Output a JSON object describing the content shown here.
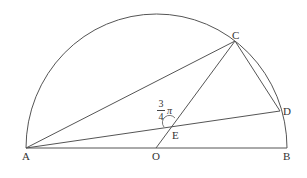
{
  "diagram": {
    "type": "semicircle geometry figure",
    "stroke_color": "#555555",
    "points": {
      "A": {
        "label": "A",
        "x": 26,
        "y": 148
      },
      "O": {
        "label": "O",
        "x": 156,
        "y": 148
      },
      "B": {
        "label": "B",
        "x": 287,
        "y": 148
      },
      "C": {
        "label": "C",
        "x": 235,
        "y": 41
      },
      "D": {
        "label": "D",
        "x": 280,
        "y": 111
      },
      "E": {
        "label": "E",
        "x": 170,
        "y": 128
      }
    },
    "segments": [
      "AB",
      "AC",
      "AD",
      "OC",
      "CD"
    ],
    "angle_mark": {
      "at": "E",
      "numerator": "3",
      "denominator": "4",
      "symbol": "π"
    }
  }
}
